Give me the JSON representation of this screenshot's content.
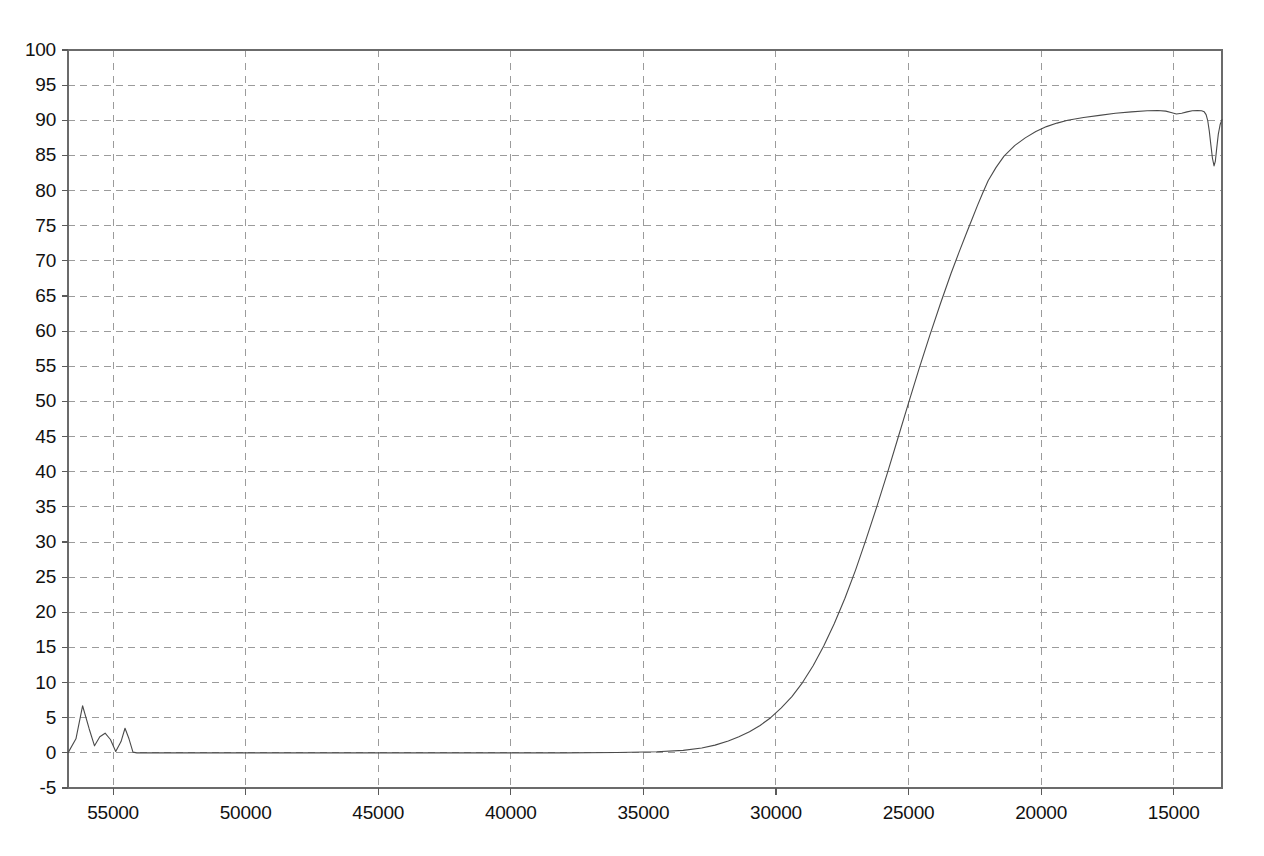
{
  "chart_data": {
    "type": "line",
    "title": "",
    "subtitle": "",
    "xlabel": "",
    "ylabel": "",
    "grid": true,
    "legend": null,
    "x_axis_reversed": true,
    "xlim": [
      56700,
      13180
    ],
    "ylim": [
      -5,
      100
    ],
    "xticks": [
      55000,
      50000,
      45000,
      40000,
      35000,
      30000,
      25000,
      20000,
      15000
    ],
    "xticklabels": [
      "55000",
      "50000",
      "45000",
      "40000",
      "35000",
      "30000",
      "25000",
      "20000",
      "15000"
    ],
    "yticks": [
      -5,
      0,
      5,
      10,
      15,
      20,
      25,
      30,
      35,
      40,
      45,
      50,
      55,
      60,
      65,
      70,
      75,
      80,
      85,
      90,
      95,
      100
    ],
    "yticklabels": [
      "-5",
      "0",
      "5",
      "10",
      "15",
      "20",
      "25",
      "30",
      "35",
      "40",
      "45",
      "50",
      "55",
      "60",
      "65",
      "70",
      "75",
      "80",
      "85",
      "90",
      "95",
      "100"
    ],
    "series": [
      {
        "name": "transmittance",
        "color": "#4a4a4a",
        "line_width": 1.1,
        "x": [
          56700,
          56400,
          56150,
          55900,
          55700,
          55500,
          55300,
          55100,
          54900,
          54700,
          54550,
          54400,
          54250,
          54100,
          53800,
          52000,
          50000,
          47000,
          44000,
          41000,
          38000,
          36000,
          34500,
          33500,
          32800,
          32300,
          31800,
          31400,
          31000,
          30600,
          30200,
          29800,
          29400,
          29000,
          28600,
          28200,
          27800,
          27400,
          27000,
          26600,
          26200,
          25800,
          25400,
          25000,
          24600,
          24200,
          23800,
          23400,
          23100,
          22800,
          22600,
          22400,
          22200,
          22000,
          21700,
          21400,
          21000,
          20600,
          20200,
          19800,
          19400,
          19000,
          18400,
          17800,
          17200,
          16600,
          16000,
          15600,
          15300,
          15100,
          14900,
          14700,
          14500,
          14300,
          14100,
          13950,
          13850,
          13780,
          13720,
          13660,
          13600,
          13540,
          13480,
          13430,
          13380,
          13320,
          13250,
          13180
        ],
        "y": [
          0.0,
          2.0,
          6.7,
          3.4,
          1.0,
          2.3,
          2.8,
          1.9,
          0.2,
          1.6,
          3.5,
          2.0,
          0.1,
          0.0,
          0.0,
          0.0,
          0.0,
          0.0,
          0.0,
          0.0,
          0.0,
          0.05,
          0.15,
          0.35,
          0.7,
          1.1,
          1.7,
          2.3,
          3.0,
          3.9,
          5.0,
          6.4,
          8.0,
          10.0,
          12.4,
          15.2,
          18.4,
          22.0,
          26.0,
          30.4,
          35.0,
          39.8,
          44.8,
          49.8,
          54.7,
          59.4,
          63.9,
          68.2,
          71.2,
          74.1,
          76.0,
          77.9,
          79.7,
          81.4,
          83.3,
          84.9,
          86.4,
          87.5,
          88.4,
          89.1,
          89.6,
          90.0,
          90.4,
          90.7,
          91.0,
          91.2,
          91.35,
          91.4,
          91.3,
          91.1,
          90.9,
          91.0,
          91.2,
          91.35,
          91.4,
          91.35,
          91.2,
          90.8,
          90.0,
          88.5,
          86.5,
          84.6,
          83.5,
          84.2,
          86.0,
          88.0,
          89.4,
          90.1
        ]
      }
    ]
  },
  "axes": {
    "frame_color": "#6b6b6b",
    "grid_color": "#9b9b9b",
    "tick_color": "#5a5a5a",
    "background": "#ffffff"
  }
}
